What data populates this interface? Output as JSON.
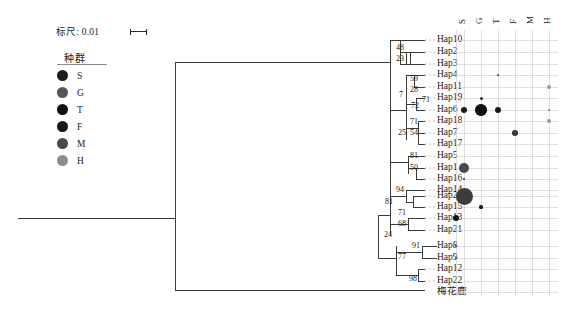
{
  "scale": {
    "label": "标尺: 0.01",
    "value": "0.01"
  },
  "legend": {
    "title": "种群",
    "items": [
      {
        "label": "S",
        "color": "#1c1c1c"
      },
      {
        "label": "G",
        "color": "#555555"
      },
      {
        "label": "T",
        "color": "#111111"
      },
      {
        "label": "F",
        "color": "#161616"
      },
      {
        "label": "M",
        "color": "#4a4a4a"
      },
      {
        "label": "H",
        "color": "#8d8d8d"
      }
    ]
  },
  "matrix": {
    "columns": [
      "S",
      "G",
      "T",
      "F",
      "M",
      "H"
    ],
    "rows": [
      {
        "label": "Hap10",
        "dots": []
      },
      {
        "label": "Hap2",
        "dots": []
      },
      {
        "label": "Hap3",
        "dots": []
      },
      {
        "label": "Hap4",
        "dots": [
          {
            "col": 2,
            "size": 2.5,
            "color": "#3c3c3c"
          }
        ]
      },
      {
        "label": "Hap11",
        "dots": [
          {
            "col": 5,
            "size": 4.2,
            "color": "#9a9a9a"
          }
        ]
      },
      {
        "label": "Hap19",
        "dots": [
          {
            "col": 1,
            "size": 3.0,
            "color": "#2e2e2e"
          }
        ]
      },
      {
        "label": "Hap6",
        "dots": [
          {
            "col": 0,
            "size": 6.0,
            "color": "#1c1c1c"
          },
          {
            "col": 1,
            "size": 11.5,
            "color": "#101010"
          },
          {
            "col": 2,
            "size": 6.0,
            "color": "#1c1c1c"
          },
          {
            "col": 5,
            "size": 2.4,
            "color": "#7d7d7d"
          }
        ]
      },
      {
        "label": "Hap18",
        "dots": [
          {
            "col": 5,
            "size": 4.0,
            "color": "#9a9a9a"
          }
        ]
      },
      {
        "label": "Hap7",
        "dots": [
          {
            "col": 3,
            "size": 5.6,
            "color": "#3a3a3a"
          }
        ]
      },
      {
        "label": "Hap17",
        "dots": []
      },
      {
        "label": "Hap5",
        "dots": []
      },
      {
        "label": "Hap1",
        "dots": [
          {
            "col": 0,
            "size": 10.5,
            "color": "#4a4a4a"
          }
        ]
      },
      {
        "label": "Hap16",
        "dots": [
          {
            "col": 0,
            "size": 2.4,
            "color": "#2e2e2e"
          }
        ]
      },
      {
        "label": "Hap14",
        "dots": []
      },
      {
        "label": "Hap20",
        "dots": [
          {
            "col": 0,
            "size": 17.0,
            "color": "#3d3d3d"
          }
        ]
      },
      {
        "label": "Hap15",
        "dots": [
          {
            "col": 1,
            "size": 3.2,
            "color": "#1c1c1c"
          }
        ]
      },
      {
        "label": "Hap13",
        "dots": [
          {
            "col": -1,
            "size": 6.0,
            "color": "#111111"
          }
        ]
      },
      {
        "label": "Hap21",
        "dots": []
      },
      {
        "label": "Hap8",
        "dots": [
          {
            "col": -1,
            "size": 2.6,
            "color": "#2e2e2e"
          }
        ]
      },
      {
        "label": "Hap9",
        "dots": [
          {
            "col": -1,
            "size": 2.4,
            "color": "#2e2e2e"
          }
        ]
      },
      {
        "label": "Hap12",
        "dots": []
      },
      {
        "label": "Hap22",
        "dots": []
      },
      {
        "label": "梅花鹿",
        "dots": []
      }
    ]
  },
  "bootstrap": [
    {
      "value": "48",
      "x": 396,
      "y": 48
    },
    {
      "value": "23",
      "x": 396,
      "y": 59
    },
    {
      "value": "59",
      "x": 410,
      "y": 79
    },
    {
      "value": "28",
      "x": 410,
      "y": 90
    },
    {
      "value": "7",
      "x": 399,
      "y": 95
    },
    {
      "value": "72",
      "x": 411,
      "y": 106
    },
    {
      "value": "71",
      "x": 422,
      "y": 100
    },
    {
      "value": "71",
      "x": 410,
      "y": 122
    },
    {
      "value": "54",
      "x": 410,
      "y": 133
    },
    {
      "value": "25",
      "x": 398,
      "y": 133
    },
    {
      "value": "81",
      "x": 410,
      "y": 156
    },
    {
      "value": "50",
      "x": 410,
      "y": 168
    },
    {
      "value": "94",
      "x": 396,
      "y": 190
    },
    {
      "value": "81",
      "x": 385,
      "y": 202
    },
    {
      "value": "71",
      "x": 398,
      "y": 213
    },
    {
      "value": "68",
      "x": 398,
      "y": 224
    },
    {
      "value": "24",
      "x": 384,
      "y": 235
    },
    {
      "value": "91",
      "x": 412,
      "y": 246
    },
    {
      "value": "77",
      "x": 398,
      "y": 257
    },
    {
      "value": "98",
      "x": 409,
      "y": 279
    }
  ]
}
